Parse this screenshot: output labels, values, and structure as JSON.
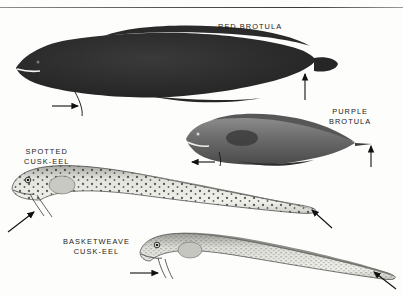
{
  "plate": {
    "title": "Deep-sea fishes identification plate",
    "background_color": "#fdfdfb",
    "ink_color": "#1a1a1a",
    "divider_rule": true
  },
  "labels": {
    "red_brotula": "RED BROTULA",
    "purple_brotula": "PURPLE\nBROTULA",
    "spotted_cusk_eel": "SPOTTED\nCUSK-EEL",
    "basketweave_cusk_eel": "BASKETWEAVE\nCUSK-EEL"
  },
  "specimens": [
    {
      "id": "red-brotula",
      "common_name": "RED BROTULA",
      "tone": "very dark / near black",
      "body_fill": "#2b2b2b",
      "orientation": "head-left",
      "pointers": [
        {
          "name": "pelvic-filament-arrow",
          "direction": "right",
          "target": "pelvic filament"
        },
        {
          "name": "caudal-fin-arrow",
          "direction": "up",
          "target": "rounded tail fin"
        }
      ]
    },
    {
      "id": "purple-brotula",
      "common_name": "PURPLE BROTULA",
      "tone": "medium-dark grey",
      "body_fill": "#6e6e6e",
      "orientation": "head-left",
      "pointers": [
        {
          "name": "pelvic-filament-arrow",
          "direction": "left",
          "target": "pelvic filament"
        },
        {
          "name": "caudal-tip-arrow",
          "direction": "up",
          "target": "pointed tail tip"
        }
      ]
    },
    {
      "id": "spotted-cusk-eel",
      "common_name": "SPOTTED CUSK-EEL",
      "tone": "pale with dark spots",
      "body_fill": "#d9d9d4",
      "orientation": "head-left",
      "pointers": [
        {
          "name": "barbel-arrow",
          "direction": "up-right",
          "target": "pelvic barbels"
        },
        {
          "name": "tail-arrow",
          "direction": "up-left",
          "target": "tapered tail"
        }
      ]
    },
    {
      "id": "basketweave-cusk-eel",
      "common_name": "BASKETWEAVE CUSK-EEL",
      "tone": "pale grey, finely speckled",
      "body_fill": "#d2d2cd",
      "orientation": "head-left",
      "pointers": [
        {
          "name": "barbel-arrow",
          "direction": "right",
          "target": "pelvic barbels"
        },
        {
          "name": "tail-arrow",
          "direction": "up-left",
          "target": "tapered tail"
        }
      ]
    }
  ]
}
